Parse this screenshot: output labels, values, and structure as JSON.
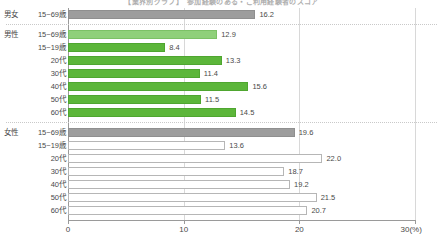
{
  "chart_data": {
    "type": "bar",
    "orientation": "horizontal",
    "title": "【業界別グラフ】　参加経験のある・ご利用経験者のスコア",
    "xlabel": "",
    "ylabel": "",
    "xlim": [
      0,
      30
    ],
    "xticks": [
      "0",
      "10",
      "20",
      "30(%)"
    ],
    "xtick_values": [
      0,
      10,
      20,
      30
    ],
    "grid": "vertical",
    "legend_position": "none",
    "axis_unit": "%",
    "groups": [
      {
        "name": "男女",
        "style": "gray",
        "rows": [
          {
            "category": "15~69歳",
            "value": 16.2,
            "label": "16.2",
            "style": "gray"
          }
        ]
      },
      {
        "name": "男性",
        "style": "green",
        "rows": [
          {
            "category": "15~69歳",
            "value": 12.9,
            "label": "12.9",
            "style": "green-light"
          },
          {
            "category": "15~19歳",
            "value": 8.4,
            "label": "8.4",
            "style": "green"
          },
          {
            "category": "20代",
            "value": 13.3,
            "label": "13.3",
            "style": "green"
          },
          {
            "category": "30代",
            "value": 11.4,
            "label": "11.4",
            "style": "green"
          },
          {
            "category": "40代",
            "value": 15.6,
            "label": "15.6",
            "style": "green"
          },
          {
            "category": "50代",
            "value": 11.5,
            "label": "11.5",
            "style": "green"
          },
          {
            "category": "60代",
            "value": 14.5,
            "label": "14.5",
            "style": "green"
          }
        ]
      },
      {
        "name": "女性",
        "style": "white",
        "rows": [
          {
            "category": "15~69歳",
            "value": 19.6,
            "label": "19.6",
            "style": "gray"
          },
          {
            "category": "15~19歳",
            "value": 13.6,
            "label": "13.6",
            "style": "white"
          },
          {
            "category": "20代",
            "value": 22.0,
            "label": "22.0",
            "style": "white"
          },
          {
            "category": "30代",
            "value": 18.7,
            "label": "18.7",
            "style": "white"
          },
          {
            "category": "40代",
            "value": 19.2,
            "label": "19.2",
            "style": "white"
          },
          {
            "category": "50代",
            "value": 21.5,
            "label": "21.5",
            "style": "white"
          },
          {
            "category": "60代",
            "value": 20.7,
            "label": "20.7",
            "style": "white"
          }
        ]
      }
    ],
    "colors": {
      "gray": "#9d9d9d",
      "green_light": "#8fd07a",
      "green": "#5cb63a",
      "white": "#ffffff",
      "outline": "#b6b6b6",
      "axis": "#9a9a9a",
      "grid": "#d8d8d8",
      "text": "#4a4a4a"
    }
  }
}
